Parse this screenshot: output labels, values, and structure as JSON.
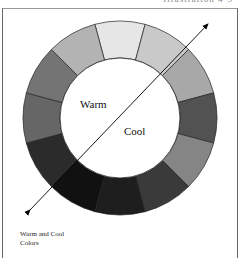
{
  "header": {
    "text": "Illustration 4-5"
  },
  "wheel": {
    "center": [
      120,
      118
    ],
    "outer_radius": 97,
    "inner_radius": 60,
    "segments": [
      {
        "index": 0,
        "color": "#e6e6e6"
      },
      {
        "index": 1,
        "color": "#c9c9c9"
      },
      {
        "index": 2,
        "color": "#a8a8a8"
      },
      {
        "index": 3,
        "color": "#525252"
      },
      {
        "index": 4,
        "color": "#858585"
      },
      {
        "index": 5,
        "color": "#3a3a3a"
      },
      {
        "index": 6,
        "color": "#1e1e1e"
      },
      {
        "index": 7,
        "color": "#111111"
      },
      {
        "index": 8,
        "color": "#2b2b2b"
      },
      {
        "index": 9,
        "color": "#666666"
      },
      {
        "index": 10,
        "color": "#747474"
      },
      {
        "index": 11,
        "color": "#b3b3b3"
      }
    ]
  },
  "labels": {
    "warm": "Warm",
    "cool": "Cool"
  },
  "caption": {
    "line1": "Warm and Cool",
    "line2": "Colors"
  }
}
